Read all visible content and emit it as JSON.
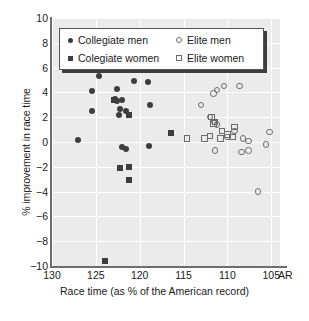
{
  "chart_data": {
    "type": "scatter",
    "title": "",
    "xlabel": "Race time (as % of the American record)",
    "ylabel": "% improvement in race time",
    "xlim": [
      130,
      104
    ],
    "ylim": [
      -10,
      10
    ],
    "x_reversed": true,
    "xticks": [
      130,
      125,
      120,
      115,
      110,
      105
    ],
    "xticklabels": [
      "130",
      "125",
      "120",
      "115",
      "110",
      "105"
    ],
    "x_axis_end_label": "AR",
    "yticks": [
      10,
      8,
      6,
      4,
      2,
      0,
      -2,
      -4,
      -6,
      -8,
      -10
    ],
    "yticklabels": [
      "10",
      "8",
      "6",
      "4",
      "2",
      "0",
      "-2",
      "-4",
      "-6",
      "-8",
      "-10"
    ],
    "grid": true,
    "grid_color": "#ffffff",
    "plot_background": "#ebebeb",
    "legend_position": "upper center",
    "series": [
      {
        "name": "Collegiate men",
        "marker": "filled-circle",
        "color": "#3d3d3d",
        "points": [
          [
            127.0,
            0.2
          ],
          [
            125.4,
            4.1
          ],
          [
            125.4,
            2.5
          ],
          [
            124.6,
            5.3
          ],
          [
            122.6,
            4.3
          ],
          [
            122.8,
            3.5
          ],
          [
            122.6,
            3.3
          ],
          [
            122.0,
            3.4
          ],
          [
            122.2,
            2.7
          ],
          [
            122.4,
            2.2
          ],
          [
            121.6,
            2.5
          ],
          [
            120.6,
            4.9
          ],
          [
            119.0,
            4.8
          ],
          [
            118.8,
            3.0
          ],
          [
            122.0,
            -0.4
          ],
          [
            121.6,
            -0.6
          ],
          [
            118.9,
            -0.3
          ]
        ]
      },
      {
        "name": "Colegiate women",
        "marker": "filled-square",
        "color": "#3d3d3d",
        "points": [
          [
            122.9,
            3.4
          ],
          [
            121.2,
            2.2
          ],
          [
            116.4,
            0.7
          ],
          [
            122.2,
            -2.1
          ],
          [
            121.2,
            -2.0
          ],
          [
            121.2,
            -3.1
          ],
          [
            124.0,
            -9.6
          ]
        ]
      },
      {
        "name": "Elite men",
        "marker": "open-circle",
        "color": "#6b6b6b",
        "points": [
          [
            110.4,
            4.5
          ],
          [
            108.6,
            4.5
          ],
          [
            111.2,
            4.2
          ],
          [
            111.6,
            3.9
          ],
          [
            113.0,
            3.0
          ],
          [
            112.0,
            2.0
          ],
          [
            111.5,
            1.6
          ],
          [
            111.2,
            1.4
          ],
          [
            110.0,
            0.4
          ],
          [
            109.2,
            0.9
          ],
          [
            108.2,
            0.3
          ],
          [
            107.6,
            0.1
          ],
          [
            105.2,
            0.8
          ],
          [
            105.6,
            -0.2
          ],
          [
            111.4,
            -0.7
          ],
          [
            108.4,
            -0.8
          ],
          [
            107.6,
            -0.7
          ],
          [
            106.5,
            -4.0
          ]
        ]
      },
      {
        "name": "Elite women",
        "marker": "open-square",
        "color": "#6b6b6b",
        "points": [
          [
            111.8,
            2.0
          ],
          [
            111.4,
            1.6
          ],
          [
            111.6,
            1.5
          ],
          [
            109.2,
            1.2
          ],
          [
            110.6,
            0.9
          ],
          [
            110.0,
            0.6
          ],
          [
            109.4,
            0.4
          ],
          [
            112.0,
            0.5
          ],
          [
            114.6,
            0.3
          ],
          [
            112.6,
            0.3
          ],
          [
            110.8,
            0.3
          ]
        ]
      }
    ]
  },
  "legend": {
    "entries": [
      {
        "label": "Collegiate men",
        "marker": "filled-circle"
      },
      {
        "label": "Elite men",
        "marker": "open-circle"
      },
      {
        "label": "Colegiate women",
        "marker": "filled-square"
      },
      {
        "label": "Elite women",
        "marker": "open-square"
      }
    ]
  }
}
